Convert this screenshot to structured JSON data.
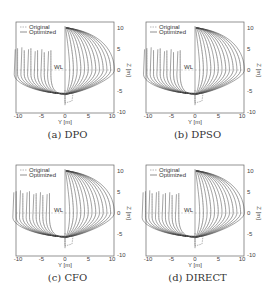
{
  "figure": {
    "panels": [
      {
        "id": "a",
        "caption": "(a) DPO"
      },
      {
        "id": "b",
        "caption": "(b) DPSO"
      },
      {
        "id": "c",
        "caption": "(c) CFO"
      },
      {
        "id": "d",
        "caption": "(d) DIRECT"
      }
    ],
    "legend": {
      "original": "Original",
      "optimized": "Optimized"
    },
    "wl_label": "WL",
    "xlabel": "Y [m]",
    "ylabel": "Z [m]",
    "xticks": [
      "-10",
      "-5",
      "0",
      "5",
      "10"
    ],
    "yticks": [
      "10",
      "5",
      "0",
      "-5",
      "-10"
    ]
  },
  "chart_data": [
    {
      "type": "line",
      "title": "(a) DPO",
      "xlabel": "Y [m]",
      "ylabel": "Z [m]",
      "xlim": [
        -12,
        12
      ],
      "ylim": [
        -10,
        10
      ],
      "xticks": [
        -10,
        -5,
        0,
        5,
        10
      ],
      "yticks": [
        -10,
        -5,
        0,
        5,
        10
      ],
      "legend": [
        "Original",
        "Optimized"
      ],
      "legend_position": "upper left",
      "annotations": [
        "WL at Z=0"
      ],
      "description": "Hull body plan: afterbody sections on left (Y<0), forebody sections on right (Y>0); original dashed, optimized solid"
    },
    {
      "type": "line",
      "title": "(b) DPSO",
      "xlabel": "Y [m]",
      "ylabel": "Z [m]",
      "xlim": [
        -12,
        12
      ],
      "ylim": [
        -10,
        10
      ],
      "xticks": [
        -10,
        -5,
        0,
        5,
        10
      ],
      "yticks": [
        -10,
        -5,
        0,
        5,
        10
      ],
      "legend": [
        "Original",
        "Optimized"
      ],
      "legend_position": "upper left",
      "annotations": [
        "WL at Z=0"
      ]
    },
    {
      "type": "line",
      "title": "(c) CFO",
      "xlabel": "Y [m]",
      "ylabel": "Z [m]",
      "xlim": [
        -12,
        12
      ],
      "ylim": [
        -10,
        10
      ],
      "xticks": [
        -10,
        -5,
        0,
        5,
        10
      ],
      "yticks": [
        -10,
        -5,
        0,
        5,
        10
      ],
      "legend": [
        "Original",
        "Optimized"
      ],
      "legend_position": "upper left",
      "annotations": [
        "WL at Z=0"
      ]
    },
    {
      "type": "line",
      "title": "(d) DIRECT",
      "xlabel": "Y [m]",
      "ylabel": "Z [m]",
      "xlim": [
        -12,
        12
      ],
      "ylim": [
        -10,
        10
      ],
      "xticks": [
        -10,
        -5,
        0,
        5,
        10
      ],
      "yticks": [
        -10,
        -5,
        0,
        5,
        10
      ],
      "legend": [
        "Original",
        "Optimized"
      ],
      "legend_position": "upper left",
      "annotations": [
        "WL at Z=0"
      ]
    }
  ]
}
